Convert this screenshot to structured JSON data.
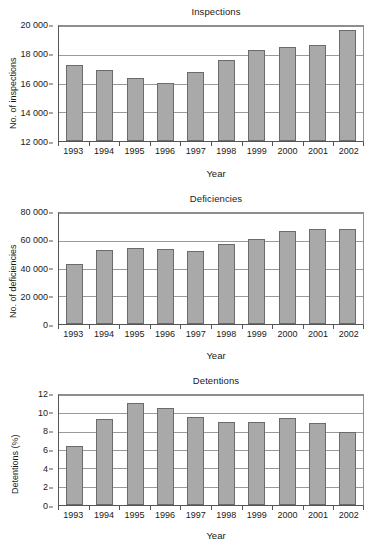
{
  "chart_data": [
    {
      "type": "bar",
      "id": "inspections",
      "title": "Inspections",
      "xlabel": "Year",
      "ylabel": "No. of inspections",
      "categories": [
        "1993",
        "1994",
        "1995",
        "1996",
        "1997",
        "1998",
        "1999",
        "2000",
        "2001",
        "2002"
      ],
      "values": [
        17300,
        16950,
        16370,
        16060,
        16800,
        17620,
        18340,
        18550,
        18670,
        19750
      ],
      "ylim": [
        12000,
        20000
      ],
      "yticks": [
        12000,
        14000,
        16000,
        18000,
        20000
      ],
      "ytick_labels": [
        "12 000",
        "14 000",
        "16 000",
        "18 000",
        "20 000"
      ],
      "grid": true,
      "legend": "none",
      "bar_fill": "#a9a9a9",
      "bar_border": "#6b6b6b"
    },
    {
      "type": "bar",
      "id": "deficiencies",
      "title": "Deficiencies",
      "xlabel": "Year",
      "ylabel": "No. of deficiencies",
      "categories": [
        "1993",
        "1994",
        "1995",
        "1996",
        "1997",
        "1998",
        "1999",
        "2000",
        "2001",
        "2002"
      ],
      "values": [
        43000,
        53000,
        54500,
        54000,
        52700,
        57700,
        61000,
        67200,
        68500,
        68800
      ],
      "ylim": [
        0,
        80000
      ],
      "yticks": [
        0,
        20000,
        40000,
        60000,
        80000
      ],
      "ytick_labels": [
        "0",
        "20 000",
        "40 000",
        "60 000",
        "80 000"
      ],
      "grid": true,
      "legend": "none",
      "bar_fill": "#a9a9a9",
      "bar_border": "#6b6b6b"
    },
    {
      "type": "bar",
      "id": "detentions",
      "title": "Detentions",
      "xlabel": "Year",
      "ylabel": "Detentions (%)",
      "categories": [
        "1993",
        "1994",
        "1995",
        "1996",
        "1997",
        "1998",
        "1999",
        "2000",
        "2001",
        "2002"
      ],
      "values": [
        6.45,
        9.4,
        11.1,
        10.6,
        9.6,
        9.05,
        9.1,
        9.45,
        9.0,
        7.95
      ],
      "ylim": [
        0,
        12
      ],
      "yticks": [
        0,
        2,
        4,
        6,
        8,
        10,
        12
      ],
      "ytick_labels": [
        "0",
        "2",
        "4",
        "6",
        "8",
        "10",
        "12"
      ],
      "grid": true,
      "legend": "none",
      "bar_fill": "#a9a9a9",
      "bar_border": "#6b6b6b"
    }
  ]
}
